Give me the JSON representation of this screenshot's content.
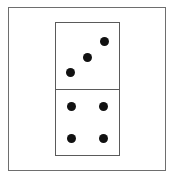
{
  "figure": {
    "top_half": {
      "pips": 3
    },
    "bottom_half": {
      "pips": 4
    },
    "pip_color": "#111111",
    "border_color": "#5a5a5a"
  }
}
